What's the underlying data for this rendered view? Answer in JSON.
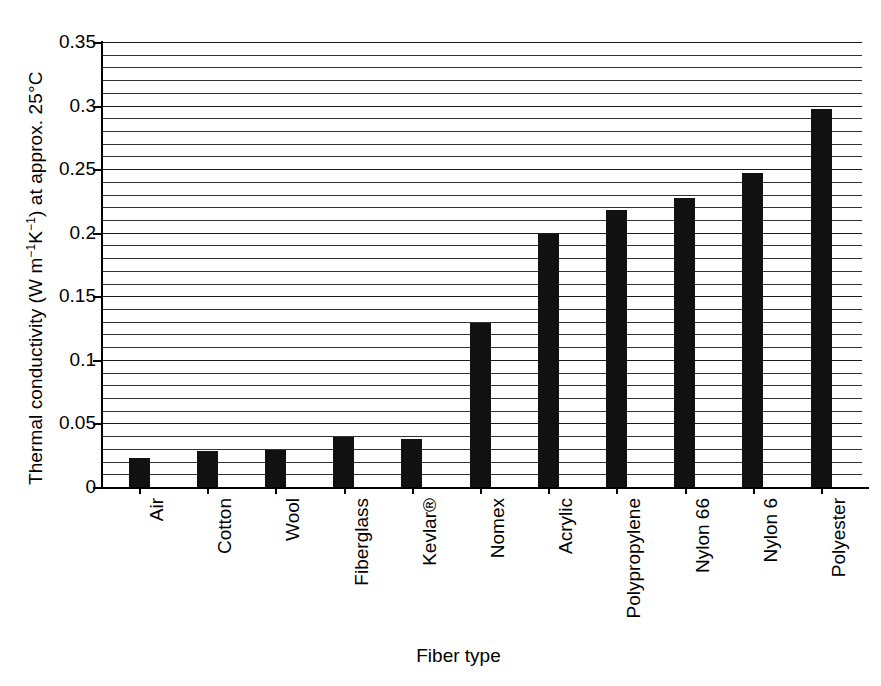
{
  "chart_data": {
    "type": "bar",
    "title": "",
    "subtitle": "",
    "xlabel": "Fiber type",
    "ylabel": "Thermal conductivity (W m⁻¹K⁻¹) at approx. 25°C",
    "ylabel_parts": {
      "pre": "Thermal conductivity (W m",
      "sup1": "−1",
      "mid": "K",
      "sup2": "−1",
      "post": ") at approx. 25°C"
    },
    "categories": [
      "Air",
      "Cotton",
      "Wool",
      "Fiberglass",
      "Kevlar®",
      "Nomex",
      "Acrylic",
      "Polypropylene",
      "Nylon 66",
      "Nylon 6",
      "Polyester"
    ],
    "values": [
      0.023,
      0.028,
      0.029,
      0.039,
      0.038,
      0.129,
      0.199,
      0.218,
      0.227,
      0.247,
      0.297
    ],
    "ylim": [
      0,
      0.35
    ],
    "ytick_major_values": [
      0,
      0.05,
      0.1,
      0.15,
      0.2,
      0.25,
      0.3,
      0.35
    ],
    "ytick_major_labels": [
      "0",
      "0.05",
      "0.1",
      "0.15",
      "0.2",
      "0.25",
      "0.3",
      "0.35"
    ],
    "ytick_minor_step": 0.01,
    "grid": "horizontal-minor-and-major",
    "legend": "none",
    "bar_color": "#111111",
    "axis_color": "#000000",
    "background": "#ffffff",
    "bar_width_px": 21,
    "annotations": []
  }
}
